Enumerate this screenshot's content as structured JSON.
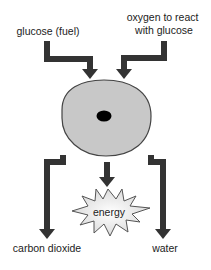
{
  "diagram": {
    "type": "process-flow",
    "inputs": [
      {
        "id": "glucose",
        "lines": [
          "glucose (fuel)"
        ]
      },
      {
        "id": "oxygen",
        "lines": [
          "oxygen to react",
          "with glucose"
        ]
      }
    ],
    "process": {
      "id": "cell",
      "shape": "ellipse with nucleus"
    },
    "outputs": [
      {
        "id": "carbon-dioxide",
        "lines": [
          "carbon dioxide"
        ]
      },
      {
        "id": "energy",
        "lines": [
          "energy"
        ],
        "shape": "starburst"
      },
      {
        "id": "water",
        "lines": [
          "water"
        ]
      }
    ],
    "colors": {
      "arrow": "#333333",
      "cell_fill": "#c8c8c8",
      "cell_stroke": "#444444",
      "nucleus": "#000000",
      "starburst_fill": "#eeeeee",
      "starburst_stroke": "#555555",
      "text": "#222222"
    }
  }
}
